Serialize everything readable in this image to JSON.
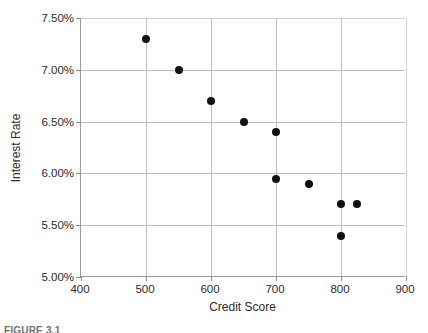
{
  "figure": {
    "caption": "FIGURE 3.1"
  },
  "chart_data": {
    "type": "scatter",
    "title": "",
    "xlabel": "Credit Score",
    "ylabel": "Interest Rate",
    "xlim": [
      400,
      900
    ],
    "ylim": [
      5.0,
      7.5
    ],
    "xticks": [
      400,
      500,
      600,
      700,
      800,
      900
    ],
    "yticks": [
      5.0,
      5.5,
      6.0,
      6.5,
      7.0,
      7.5
    ],
    "xtick_labels": [
      "400",
      "500",
      "600",
      "700",
      "800",
      "900"
    ],
    "ytick_labels": [
      "5.00%",
      "5.50%",
      "6.00%",
      "6.50%",
      "7.00%",
      "7.50%"
    ],
    "grid": true,
    "legend": "none",
    "marker_color": "#111111",
    "grid_color": "#bdbdbd",
    "axis_color": "#9a9a9a",
    "points": [
      {
        "x": 500,
        "y": 7.3,
        "label": "7.30%"
      },
      {
        "x": 550,
        "y": 7.0,
        "label": "7.00%"
      },
      {
        "x": 600,
        "y": 6.7,
        "label": "6.70%"
      },
      {
        "x": 650,
        "y": 6.5,
        "label": "6.50%"
      },
      {
        "x": 700,
        "y": 6.4,
        "label": "6.40%"
      },
      {
        "x": 700,
        "y": 5.95,
        "label": "5.95%"
      },
      {
        "x": 750,
        "y": 5.9,
        "label": "5.90%"
      },
      {
        "x": 800,
        "y": 5.7,
        "label": "5.70%"
      },
      {
        "x": 825,
        "y": 5.7,
        "label": "5.70%"
      },
      {
        "x": 800,
        "y": 5.4,
        "label": "5.40%"
      }
    ]
  }
}
